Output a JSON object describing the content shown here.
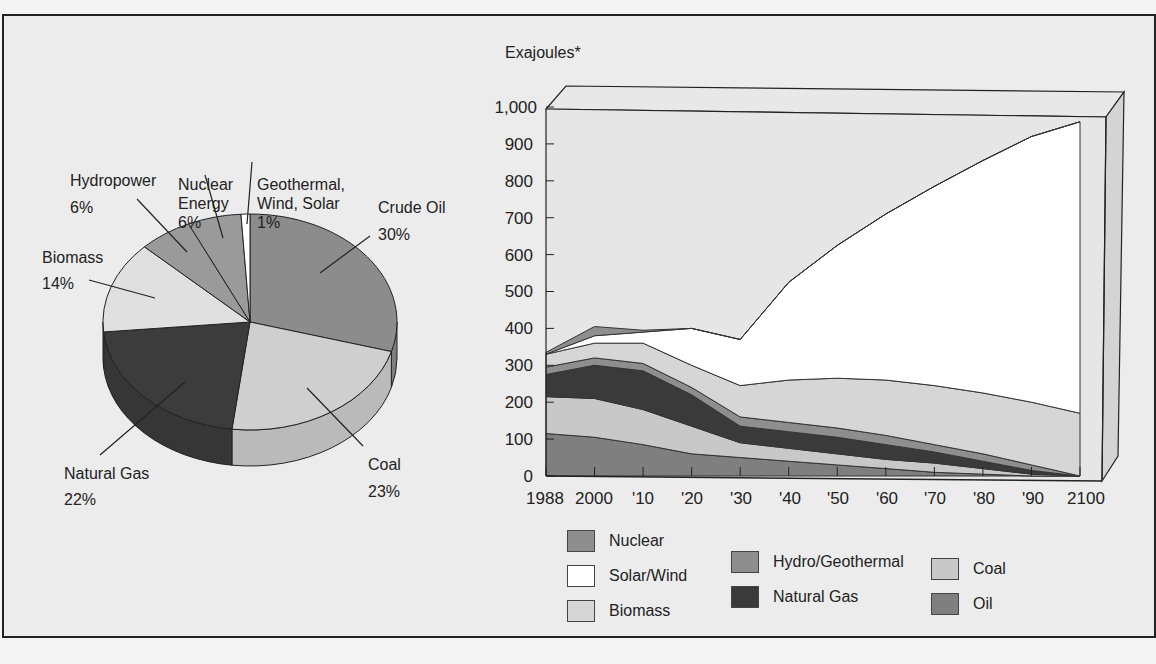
{
  "pie": {
    "slices": [
      {
        "label_line1": "Crude Oil",
        "label_line2": "30%",
        "value": 30,
        "color": "#8c8c8c"
      },
      {
        "label_line1": "Coal",
        "label_line2": "23%",
        "value": 23,
        "color": "#cfcfcf"
      },
      {
        "label_line1": "Natural Gas",
        "label_line2": "22%",
        "value": 22,
        "color": "#3c3c3c"
      },
      {
        "label_line1": "Biomass",
        "label_line2": "14%",
        "value": 14,
        "color": "#e0e0e0"
      },
      {
        "label_line1": "Hydropower",
        "label_line2": "6%",
        "value": 6,
        "color": "#9a9a9a"
      },
      {
        "label_line1": "Nuclear",
        "label_line2": "Energy",
        "label_line3": "6%",
        "value": 6,
        "color": "#9a9a9a"
      },
      {
        "label_line1": "Geothermal,",
        "label_line2": "Wind, Solar",
        "label_line3": "1%",
        "value": 1,
        "color": "#ffffff"
      }
    ]
  },
  "area": {
    "ylabel": "Exajoules*",
    "yticks": [
      "0",
      "100",
      "200",
      "300",
      "400",
      "500",
      "600",
      "700",
      "800",
      "900",
      "1,000"
    ],
    "xticks": [
      "1988",
      "2000",
      "'10",
      "'20",
      "'30",
      "'40",
      "'50",
      "'60",
      "'70",
      "'80",
      "'90",
      "2100"
    ]
  },
  "legend": {
    "nuclear": "Nuclear",
    "solar_wind": "Solar/Wind",
    "biomass": "Biomass",
    "hydro_geo": "Hydro/Geothermal",
    "natural_gas": "Natural Gas",
    "coal": "Coal",
    "oil": "Oil"
  },
  "colors": {
    "oil": "#7f7f7f",
    "coal": "#c8c8c8",
    "natural_gas": "#3a3a3a",
    "hydro_geo": "#8e8e8e",
    "biomass": "#d6d6d6",
    "solar_wind": "#ffffff",
    "nuclear": "#8e8e8e",
    "panel": "#e6e6e6"
  },
  "chart_data": [
    {
      "type": "pie",
      "title": "",
      "categories": [
        "Crude Oil",
        "Coal",
        "Natural Gas",
        "Biomass",
        "Hydropower",
        "Nuclear Energy",
        "Geothermal, Wind, Solar"
      ],
      "values": [
        30,
        23,
        22,
        14,
        6,
        6,
        1
      ],
      "unit": "%"
    },
    {
      "type": "area",
      "stacked": true,
      "title": "",
      "xlabel": "",
      "ylabel": "Exajoules*",
      "ylim": [
        0,
        1000
      ],
      "x": [
        1988,
        2000,
        2010,
        2020,
        2030,
        2040,
        2050,
        2060,
        2070,
        2080,
        2090,
        2100
      ],
      "series": [
        {
          "name": "Oil",
          "values": [
            115,
            105,
            85,
            60,
            50,
            40,
            30,
            20,
            10,
            5,
            0,
            0
          ]
        },
        {
          "name": "Coal",
          "values": [
            100,
            105,
            95,
            75,
            40,
            35,
            30,
            25,
            25,
            15,
            5,
            0
          ]
        },
        {
          "name": "Natural Gas",
          "values": [
            60,
            90,
            105,
            85,
            45,
            45,
            45,
            40,
            30,
            20,
            10,
            0
          ]
        },
        {
          "name": "Hydro/Geothermal",
          "values": [
            20,
            20,
            20,
            20,
            25,
            25,
            25,
            25,
            20,
            20,
            15,
            0
          ]
        },
        {
          "name": "Biomass",
          "values": [
            35,
            40,
            55,
            60,
            85,
            115,
            135,
            150,
            160,
            165,
            170,
            170
          ]
        },
        {
          "name": "Solar/Wind",
          "values": [
            0,
            20,
            30,
            100,
            125,
            265,
            360,
            450,
            540,
            630,
            720,
            790
          ]
        },
        {
          "name": "Nuclear",
          "values": [
            5,
            25,
            5,
            0,
            0,
            0,
            0,
            0,
            0,
            0,
            0,
            0
          ]
        }
      ],
      "legend_position": "bottom",
      "grid": false
    }
  ]
}
